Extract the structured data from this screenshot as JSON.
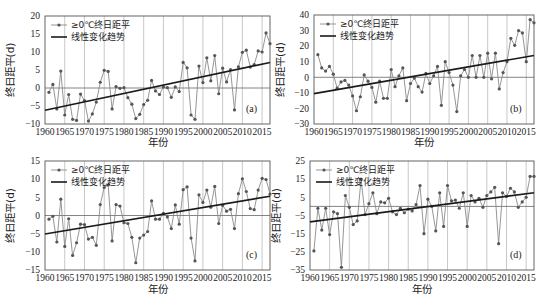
{
  "chart_data": [
    {
      "type": "line",
      "panel": "(a)",
      "xlabel": "年份",
      "ylabel": "终日距平(d)",
      "xlim": [
        1960,
        2017
      ],
      "ylim": [
        -10,
        20
      ],
      "yticks": [
        20,
        15,
        10,
        5,
        0,
        -5,
        -10
      ],
      "xticks": [
        1960,
        1965,
        1970,
        1975,
        1980,
        1985,
        1990,
        1995,
        2000,
        2005,
        2010,
        2015
      ],
      "legend": [
        "≥0℃终日距平",
        "线性变化趋势"
      ],
      "grid": "vertical every 5 years",
      "x": [
        1961,
        1962,
        1963,
        1964,
        1965,
        1966,
        1967,
        1968,
        1969,
        1970,
        1971,
        1972,
        1973,
        1974,
        1975,
        1976,
        1977,
        1978,
        1979,
        1980,
        1981,
        1982,
        1983,
        1984,
        1985,
        1986,
        1987,
        1988,
        1989,
        1990,
        1991,
        1992,
        1993,
        1994,
        1995,
        1996,
        1997,
        1998,
        1999,
        2000,
        2001,
        2002,
        2003,
        2004,
        2005,
        2006,
        2007,
        2008,
        2009,
        2010,
        2011,
        2012,
        2013,
        2014,
        2015,
        2016,
        2017
      ],
      "series": [
        {
          "name": "≥0℃终日距平",
          "values": [
            -1.2,
            1,
            -5.8,
            4.7,
            -7.5,
            -1.8,
            -8.7,
            -9,
            -1.7,
            -3.5,
            -9.2,
            -7.2,
            -3.9,
            1.6,
            4.9,
            4.6,
            -5.8,
            0.4,
            -0.1,
            0.1,
            -2.7,
            -4.5,
            -8.5,
            -7.3,
            -4.6,
            -3.4,
            2.1,
            -0.8,
            -1.8,
            0.3,
            0.1,
            -2.6,
            0.3,
            -1,
            7.1,
            5.6,
            -7.5,
            -8.7,
            6.1,
            1.5,
            8.4,
            2,
            9,
            -1.6,
            5.5,
            1.7,
            5.1,
            -6.1,
            5.9,
            9.9,
            10.5,
            5.8,
            6.5,
            10.3,
            10,
            15.3,
            12.3
          ]
        },
        {
          "name": "线性变化趋势",
          "values_endpoints": {
            "1960": -6.2,
            "2017": 7.1
          }
        }
      ]
    },
    {
      "type": "line",
      "panel": "(b)",
      "xlabel": "年份",
      "ylabel": "终日距平(d)",
      "xlim": [
        1960,
        2017
      ],
      "ylim": [
        -30,
        40
      ],
      "yticks": [
        40,
        30,
        20,
        10,
        0,
        -10,
        -20,
        -30
      ],
      "xticks": [
        1960,
        1965,
        1970,
        1975,
        1980,
        1985,
        1990,
        1995,
        2000,
        2005,
        2010,
        2015
      ],
      "legend": [
        "≥0℃终日距平",
        "线性变化趋势"
      ],
      "grid": "vertical every 5 years",
      "x": [
        1961,
        1962,
        1963,
        1964,
        1965,
        1966,
        1967,
        1968,
        1969,
        1970,
        1971,
        1972,
        1973,
        1974,
        1975,
        1976,
        1977,
        1978,
        1979,
        1980,
        1981,
        1982,
        1983,
        1984,
        1985,
        1986,
        1987,
        1988,
        1989,
        1990,
        1991,
        1992,
        1993,
        1994,
        1995,
        1996,
        1997,
        1998,
        1999,
        2000,
        2001,
        2002,
        2003,
        2004,
        2005,
        2006,
        2007,
        2008,
        2009,
        2010,
        2011,
        2012,
        2013,
        2014,
        2015,
        2016,
        2017
      ],
      "series": [
        {
          "name": "≥0℃终日距平",
          "values": [
            14.5,
            6,
            4,
            7,
            2,
            -7,
            -3,
            -2,
            -5,
            -12,
            -21.5,
            -12.5,
            1.5,
            -2.5,
            -6.5,
            -16,
            -2.5,
            -13.5,
            -13.5,
            5,
            -6,
            1,
            6,
            -15,
            -4,
            -0.5,
            -6,
            -9.5,
            2.5,
            -4,
            1,
            7,
            -18,
            10,
            3,
            -5,
            -22,
            1,
            5,
            0,
            14,
            0,
            14,
            0,
            15.5,
            -1,
            15.5,
            -7.5,
            3,
            10,
            25,
            20.5,
            30,
            28.5,
            10,
            37,
            35
          ]
        },
        {
          "name": "线性变化趋势",
          "values_endpoints": {
            "1960": -10.5,
            "2017": 14
          }
        }
      ]
    },
    {
      "type": "line",
      "panel": "(c)",
      "xlabel": "年份",
      "ylabel": "终日距平(d)",
      "xlim": [
        1960,
        2017
      ],
      "ylim": [
        -15,
        15
      ],
      "yticks": [
        15,
        10,
        5,
        0,
        -5,
        -10,
        -15
      ],
      "xticks": [
        1960,
        1965,
        1970,
        1975,
        1980,
        1985,
        1990,
        1995,
        2000,
        2005,
        2010,
        2015
      ],
      "legend": [
        "≥0℃终日距平",
        "线性变化趋势"
      ],
      "grid": "vertical every 5 years",
      "x": [
        1961,
        1962,
        1963,
        1964,
        1965,
        1966,
        1967,
        1968,
        1969,
        1970,
        1971,
        1972,
        1973,
        1974,
        1975,
        1976,
        1977,
        1978,
        1979,
        1980,
        1981,
        1982,
        1983,
        1984,
        1985,
        1986,
        1987,
        1988,
        1989,
        1990,
        1991,
        1992,
        1993,
        1994,
        1995,
        1996,
        1997,
        1998,
        1999,
        2000,
        2001,
        2002,
        2003,
        2004,
        2005,
        2006,
        2007,
        2008,
        2009,
        2010,
        2011,
        2012,
        2013,
        2014,
        2015,
        2016,
        2017
      ],
      "series": [
        {
          "name": "≥0℃终日距平",
          "values": [
            -1,
            -0.2,
            -7.3,
            4.5,
            -8.5,
            -0.9,
            -11,
            -7.5,
            -2.4,
            -2.5,
            -6.5,
            -6,
            -8.2,
            3,
            7.7,
            8.4,
            -7,
            3,
            2.6,
            -2,
            -2.2,
            -6,
            -13,
            -6.2,
            -5.4,
            -4.4,
            4,
            -1,
            -1,
            0.6,
            -0.4,
            -3.6,
            2.9,
            -2.4,
            7.1,
            7.9,
            -6.2,
            -12.5,
            5.7,
            3.6,
            7,
            2.3,
            8,
            -2.2,
            2.8,
            1.2,
            1.7,
            -3.6,
            6,
            10.1,
            6.6,
            1.9,
            1.6,
            7,
            10.2,
            9.9,
            5.9
          ]
        },
        {
          "name": "线性变化趋势",
          "values_endpoints": {
            "1960": -5.1,
            "2017": 5.3
          }
        }
      ]
    },
    {
      "type": "line",
      "panel": "(d)",
      "xlabel": "年份",
      "ylabel": "终日距平(d)",
      "xlim": [
        1960,
        2017
      ],
      "ylim": [
        -35,
        25
      ],
      "yticks": [
        25,
        15,
        5,
        -5,
        -15,
        -25,
        -35
      ],
      "xticks": [
        1960,
        1965,
        1970,
        1975,
        1980,
        1985,
        1990,
        1995,
        2000,
        2005,
        2010,
        2015
      ],
      "legend": [
        "≥0℃终日距平",
        "线性变化趋势"
      ],
      "grid": "vertical every 5 years",
      "x": [
        1961,
        1962,
        1963,
        1964,
        1965,
        1966,
        1967,
        1968,
        1969,
        1970,
        1971,
        1972,
        1973,
        1974,
        1975,
        1976,
        1977,
        1978,
        1979,
        1980,
        1981,
        1982,
        1983,
        1984,
        1985,
        1986,
        1987,
        1988,
        1989,
        1990,
        1991,
        1992,
        1993,
        1994,
        1995,
        1996,
        1997,
        1998,
        1999,
        2000,
        2001,
        2002,
        2003,
        2004,
        2005,
        2006,
        2007,
        2008,
        2009,
        2010,
        2011,
        2012,
        2013,
        2014,
        2015,
        2016,
        2017
      ],
      "series": [
        {
          "name": "≥0℃终日距平",
          "values": [
            -24.5,
            -1,
            -13,
            -1,
            -15.5,
            -3,
            -4,
            -33.5,
            6,
            -0.5,
            -10,
            -8,
            15,
            -4.5,
            1.5,
            7.5,
            -4,
            2.5,
            2,
            4.5,
            -3,
            -4.5,
            -1,
            -3.5,
            -1.5,
            -2.5,
            1,
            11.5,
            -15,
            4,
            0,
            -13.5,
            7.5,
            -11,
            11.5,
            3,
            3.5,
            -1,
            7.5,
            -11,
            6,
            2.5,
            4.5,
            -0.5,
            6,
            8,
            10.5,
            -20.5,
            7.5,
            5.5,
            10,
            8,
            -0.5,
            2.5,
            5,
            16.5,
            16.5
          ]
        },
        {
          "name": "线性变化趋势",
          "values_endpoints": {
            "1960": -8.5,
            "2017": 7.5
          }
        }
      ]
    }
  ],
  "panels": [
    {
      "id": "a",
      "label": "(a)",
      "legend_series": "≥0℃终日距平",
      "legend_trend": "线性变化趋势",
      "ylabel": "终日距平(d)",
      "xlabel": "年份"
    },
    {
      "id": "b",
      "label": "(b)",
      "legend_series": "≥0℃终日距平",
      "legend_trend": "线性变化趋势",
      "ylabel": "终日距平(d)",
      "xlabel": "年份"
    },
    {
      "id": "c",
      "label": "(c)",
      "legend_series": "≥0℃终日距平",
      "legend_trend": "线性变化趋势",
      "ylabel": "终日距平(d)",
      "xlabel": "年份"
    },
    {
      "id": "d",
      "label": "(d)",
      "legend_series": "≥0℃终日距平",
      "legend_trend": "线性变化趋势",
      "ylabel": "终日距平(d)",
      "xlabel": "年份"
    }
  ],
  "colors": {
    "series_line": "#8a8a8a",
    "marker": "#555555",
    "trend": "#1a1a1a",
    "grid": "#b0b0b0",
    "axis": "#555555"
  }
}
